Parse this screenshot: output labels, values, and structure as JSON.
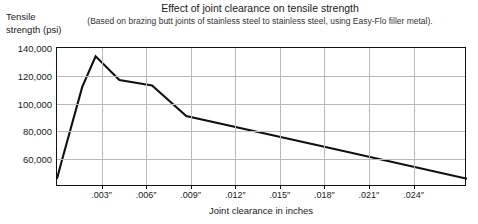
{
  "chart_data": {
    "type": "line",
    "title": "Effect of joint clearance on tensile strength",
    "subtitle": "(Based on brazing butt joints of stainless steel to stainless steel, using Easy-Flo filler metal).",
    "xlabel": "Joint clearance in inches",
    "ylabel": "Tensile strength (psi)",
    "xlim": [
      0,
      0.0276
    ],
    "ylim": [
      40000,
      140000
    ],
    "grid": true,
    "legend": null,
    "yticks": [
      {
        "value": 140000,
        "label": "140,000"
      },
      {
        "value": 120000,
        "label": "120,000"
      },
      {
        "value": 100000,
        "label": "100,000"
      },
      {
        "value": 80000,
        "label": "80,000"
      },
      {
        "value": 60000,
        "label": "60,000"
      }
    ],
    "xticks": [
      {
        "value": 0.003,
        "label": ".003″"
      },
      {
        "value": 0.006,
        "label": ".006″"
      },
      {
        "value": 0.009,
        "label": ".009″"
      },
      {
        "value": 0.012,
        "label": ".012″"
      },
      {
        "value": 0.015,
        "label": ".015″"
      },
      {
        "value": 0.018,
        "label": ".018″"
      },
      {
        "value": 0.021,
        "label": ".021″"
      },
      {
        "value": 0.024,
        "label": ".024″"
      }
    ],
    "series": [
      {
        "name": "Tensile strength",
        "color": "#111111",
        "x": [
          0.0,
          0.0003,
          0.0017,
          0.0026,
          0.0042,
          0.0064,
          0.0087,
          0.018,
          0.0276
        ],
        "y": [
          46000,
          58000,
          112000,
          134000,
          117000,
          113000,
          91000,
          69000,
          46000
        ]
      }
    ]
  }
}
